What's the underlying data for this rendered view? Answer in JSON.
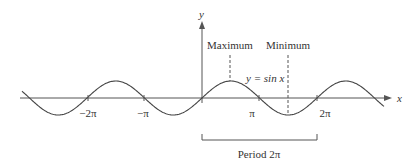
{
  "figure": {
    "axis_labels": {
      "x": "x",
      "y": "y"
    },
    "curve_label": "y = sin x",
    "ticks": [
      {
        "label": "−2π",
        "value": -6.2832
      },
      {
        "label": "−π",
        "value": -3.1416
      },
      {
        "label": "π",
        "value": 3.1416
      },
      {
        "label": "2π",
        "value": 6.2832
      }
    ],
    "annotations": {
      "maximum": "Maximum",
      "minimum": "Minimum",
      "period": "Period 2π"
    },
    "colors": {
      "curve": "#444444",
      "axis": "#555555",
      "text": "#333333"
    }
  }
}
